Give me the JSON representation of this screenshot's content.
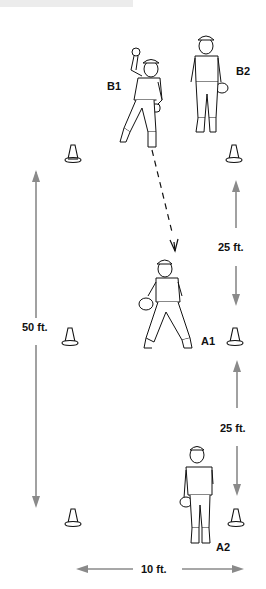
{
  "diagram": {
    "title": "",
    "players": [
      {
        "id": "B1",
        "label": "B1",
        "pose": "throwing"
      },
      {
        "id": "B2",
        "label": "B2",
        "pose": "standing"
      },
      {
        "id": "A1",
        "label": "A1",
        "pose": "receiving"
      },
      {
        "id": "A2",
        "label": "A2",
        "pose": "standing-back"
      }
    ],
    "measurements": {
      "total_length": "50 ft.",
      "segment_upper": "25 ft.",
      "segment_lower": "25 ft.",
      "width": "10 ft."
    },
    "cones": 6,
    "colors": {
      "arrow": "#8a8a8a",
      "ink": "#111111",
      "topbar": "#ececec"
    },
    "throw_path": "dashed arrow from B1 to A1"
  }
}
